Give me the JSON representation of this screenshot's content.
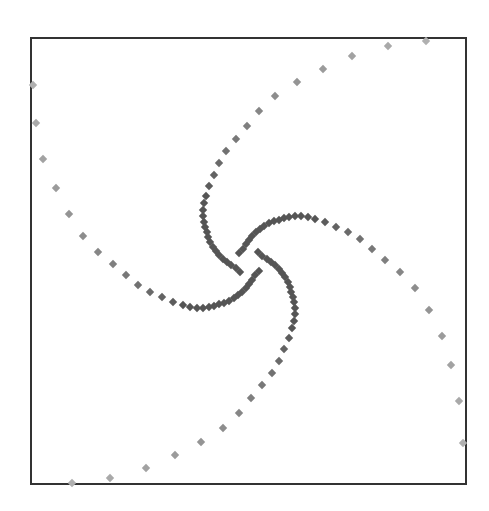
{
  "chart_data": {
    "type": "scatter",
    "title": "",
    "xlabel": "",
    "ylabel": "",
    "grid": false,
    "legend": null,
    "frame": {
      "x0": 31,
      "y0": 38,
      "x1": 466,
      "y1": 484,
      "stroke": "#333333"
    },
    "marker": {
      "shape": "diamond",
      "size": 4.2,
      "inner_color": "#555555",
      "outer_color": "#b0b0b0"
    },
    "series": [
      {
        "name": "arm-1",
        "points": [
          [
            240,
            272
          ],
          [
            236,
            268
          ],
          [
            231,
            265
          ],
          [
            227,
            262
          ],
          [
            223,
            259
          ],
          [
            219,
            255
          ],
          [
            216,
            251
          ],
          [
            213,
            247
          ],
          [
            210,
            242
          ],
          [
            208,
            237
          ],
          [
            207,
            232
          ],
          [
            205,
            227
          ],
          [
            204,
            222
          ],
          [
            203,
            216
          ],
          [
            203,
            210
          ],
          [
            204,
            203
          ],
          [
            206,
            196
          ],
          [
            209,
            186
          ],
          [
            214,
            175
          ],
          [
            219,
            163
          ],
          [
            226,
            151
          ],
          [
            236,
            139
          ],
          [
            247,
            126
          ],
          [
            259,
            111
          ],
          [
            275,
            96
          ],
          [
            297,
            82
          ],
          [
            323,
            69
          ],
          [
            352,
            56
          ],
          [
            388,
            46
          ],
          [
            426,
            41
          ]
        ]
      },
      {
        "name": "arm-2",
        "points": [
          [
            239,
            253
          ],
          [
            243,
            249
          ],
          [
            246,
            244
          ],
          [
            249,
            240
          ],
          [
            252,
            236
          ],
          [
            256,
            232
          ],
          [
            260,
            229
          ],
          [
            264,
            226
          ],
          [
            269,
            223
          ],
          [
            274,
            221
          ],
          [
            279,
            220
          ],
          [
            284,
            218
          ],
          [
            289,
            217
          ],
          [
            295,
            216
          ],
          [
            301,
            216
          ],
          [
            308,
            217
          ],
          [
            315,
            219
          ],
          [
            325,
            222
          ],
          [
            336,
            227
          ],
          [
            348,
            232
          ],
          [
            360,
            239
          ],
          [
            372,
            249
          ],
          [
            385,
            260
          ],
          [
            400,
            272
          ],
          [
            415,
            288
          ],
          [
            429,
            310
          ],
          [
            442,
            336
          ],
          [
            451,
            365
          ],
          [
            459,
            401
          ],
          [
            463,
            443
          ]
        ]
      },
      {
        "name": "arm-3",
        "points": [
          [
            258,
            252
          ],
          [
            262,
            256
          ],
          [
            267,
            259
          ],
          [
            271,
            262
          ],
          [
            275,
            265
          ],
          [
            279,
            269
          ],
          [
            282,
            273
          ],
          [
            285,
            277
          ],
          [
            288,
            282
          ],
          [
            290,
            287
          ],
          [
            291,
            292
          ],
          [
            293,
            297
          ],
          [
            294,
            302
          ],
          [
            295,
            308
          ],
          [
            295,
            314
          ],
          [
            294,
            321
          ],
          [
            292,
            328
          ],
          [
            289,
            338
          ],
          [
            284,
            349
          ],
          [
            279,
            361
          ],
          [
            272,
            373
          ],
          [
            262,
            385
          ],
          [
            251,
            398
          ],
          [
            239,
            413
          ],
          [
            223,
            428
          ],
          [
            201,
            442
          ],
          [
            175,
            455
          ],
          [
            146,
            468
          ],
          [
            110,
            478
          ],
          [
            72,
            483
          ]
        ]
      },
      {
        "name": "arm-4",
        "points": [
          [
            259,
            271
          ],
          [
            255,
            275
          ],
          [
            252,
            280
          ],
          [
            249,
            284
          ],
          [
            246,
            288
          ],
          [
            242,
            292
          ],
          [
            238,
            295
          ],
          [
            234,
            298
          ],
          [
            229,
            301
          ],
          [
            224,
            303
          ],
          [
            219,
            304
          ],
          [
            214,
            306
          ],
          [
            209,
            307
          ],
          [
            203,
            308
          ],
          [
            197,
            308
          ],
          [
            190,
            307
          ],
          [
            183,
            305
          ],
          [
            173,
            302
          ],
          [
            162,
            297
          ],
          [
            150,
            292
          ],
          [
            138,
            285
          ],
          [
            126,
            275
          ],
          [
            113,
            264
          ],
          [
            98,
            252
          ],
          [
            83,
            236
          ],
          [
            69,
            214
          ],
          [
            56,
            188
          ],
          [
            43,
            159
          ],
          [
            36,
            123
          ],
          [
            33,
            85
          ]
        ]
      }
    ]
  }
}
